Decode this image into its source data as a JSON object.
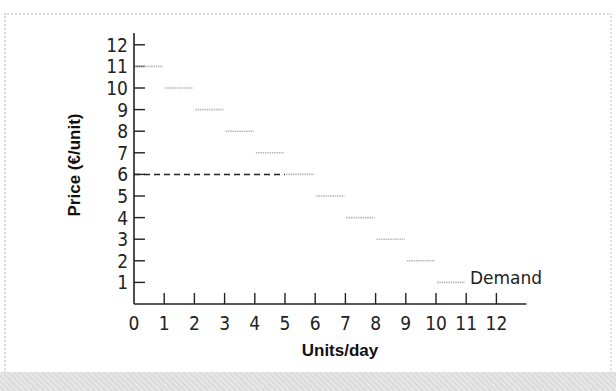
{
  "chart_data": {
    "type": "line",
    "subtype": "step",
    "title": "",
    "xlabel": "Units/day",
    "ylabel": "Price (€/unit)",
    "xlim": [
      0,
      12
    ],
    "ylim": [
      0,
      12
    ],
    "x_ticks": [
      "0",
      "1",
      "2",
      "3",
      "4",
      "5",
      "6",
      "7",
      "8",
      "9",
      "10",
      "11",
      "12"
    ],
    "y_ticks": [
      "1",
      "2",
      "3",
      "4",
      "5",
      "6",
      "7",
      "8",
      "9",
      "10",
      "11",
      "12"
    ],
    "grid": false,
    "series": [
      {
        "name": "Demand",
        "style": "step segments, light gray",
        "segments": [
          {
            "price": 11,
            "x_from": 0,
            "x_to": 1
          },
          {
            "price": 10,
            "x_from": 1,
            "x_to": 2
          },
          {
            "price": 9,
            "x_from": 2,
            "x_to": 3
          },
          {
            "price": 8,
            "x_from": 3,
            "x_to": 4
          },
          {
            "price": 7,
            "x_from": 4,
            "x_to": 5
          },
          {
            "price": 6,
            "x_from": 5,
            "x_to": 6
          },
          {
            "price": 5,
            "x_from": 6,
            "x_to": 7
          },
          {
            "price": 4,
            "x_from": 7,
            "x_to": 8
          },
          {
            "price": 3,
            "x_from": 8,
            "x_to": 9
          },
          {
            "price": 2,
            "x_from": 9,
            "x_to": 10
          },
          {
            "price": 1,
            "x_from": 10,
            "x_to": 11
          }
        ]
      }
    ],
    "annotations": [
      {
        "type": "dashed-hline",
        "y": 6,
        "x_from": 0,
        "x_to": 5
      },
      {
        "type": "label",
        "text": "Demand",
        "near": {
          "x": 11,
          "y": 1
        }
      }
    ],
    "legend": "inline label at end of series"
  },
  "labels": {
    "xlabel": "Units/day",
    "ylabel": "Price (€/unit)",
    "demand": "Demand"
  },
  "colors": {
    "axis": "#222222",
    "demand_step": "#b8b8b8",
    "dashed": "#222222"
  }
}
